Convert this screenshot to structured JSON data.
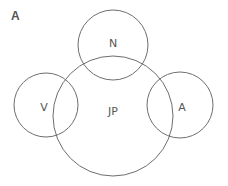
{
  "panel_label": "A",
  "diagram": {
    "type": "venn",
    "sets": [
      {
        "id": "JP",
        "label": "JP",
        "cx": 113,
        "cy": 116,
        "r": 60
      },
      {
        "id": "N",
        "label": "N",
        "cx": 113,
        "cy": 45,
        "r": 35
      },
      {
        "id": "V",
        "label": "V",
        "cx": 46,
        "cy": 105,
        "r": 32
      },
      {
        "id": "A",
        "label": "A",
        "cx": 180,
        "cy": 105,
        "r": 33
      }
    ],
    "stroke_color": "#6e6e6e",
    "text_color": "#555555"
  }
}
